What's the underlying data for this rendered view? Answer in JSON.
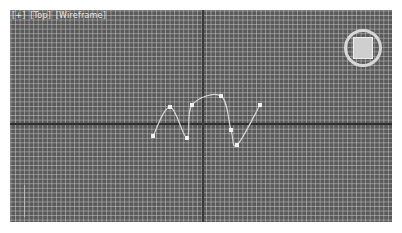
{
  "viewport": {
    "label": {
      "plus": "[+]",
      "view": "[Top]",
      "shading": "[Wireframe]"
    },
    "viewcube": {
      "face": "TOP",
      "icon": "viewcube-icon"
    },
    "colors": {
      "background": "#5a5a5a",
      "grid_line": "#c8c8c8",
      "axis_line": "#2e2e2e",
      "spline": "#d6d6d6",
      "vertex": "#f0f0f0"
    },
    "spline": {
      "name": "line-spline",
      "vertices": [
        {
          "x": 153,
          "y": 136
        },
        {
          "x": 170,
          "y": 107
        },
        {
          "x": 187,
          "y": 138
        },
        {
          "x": 192,
          "y": 105
        },
        {
          "x": 221,
          "y": 96
        },
        {
          "x": 231,
          "y": 130
        },
        {
          "x": 237,
          "y": 145
        },
        {
          "x": 260,
          "y": 105
        }
      ]
    }
  }
}
